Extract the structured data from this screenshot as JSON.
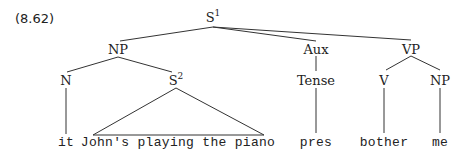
{
  "example_number": "(8.62)",
  "tree": {
    "root": {
      "label": "S",
      "superscript": "1"
    },
    "np": {
      "label": "NP"
    },
    "aux": {
      "label": "Aux"
    },
    "vp": {
      "label": "VP"
    },
    "n": {
      "label": "N"
    },
    "s2": {
      "label": "S",
      "superscript": "2"
    },
    "tense": {
      "label": "Tense"
    },
    "v": {
      "label": "V"
    },
    "np2": {
      "label": "NP"
    },
    "leaves": {
      "it": "it",
      "s2_phrase": "John's playing the piano",
      "pres": "pres",
      "bother": "bother",
      "me": "me"
    }
  }
}
